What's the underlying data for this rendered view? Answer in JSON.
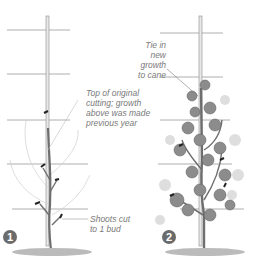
{
  "figure": {
    "panels": [
      {
        "number": "1",
        "labels": {
          "top_of_cutting": "Top of original\ncutting; growth\nabove was made\nprevious year",
          "shoots_cut": "Shoots cut\nto 1 bud"
        }
      },
      {
        "number": "2",
        "labels": {
          "tie_in": "Tie in new\ngrowth\nto cane"
        }
      }
    ],
    "colors": {
      "wire": "#9a9a9a",
      "cane": "#8a8a8a",
      "stem": "#6e6e6e",
      "leaf": "#8c8c8c",
      "leaf_light": "#d8d8d8",
      "ground": "#9c9c9c",
      "tie": "#222222",
      "text": "#7a7a7a"
    }
  }
}
